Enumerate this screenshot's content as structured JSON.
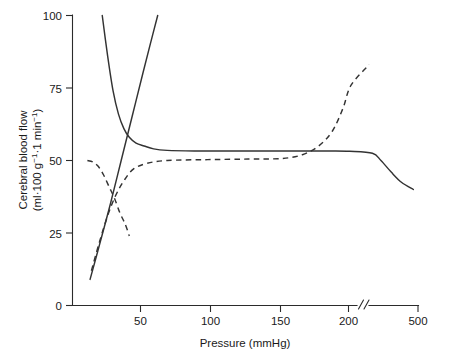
{
  "chart_data": {
    "type": "line",
    "title": "",
    "xlabel": "Pressure (mmHg)",
    "ylabel_line1": "Cerebral blood flow",
    "ylabel_line2_prefix": "(ml·100 g",
    "ylabel_line2_sup1": "−1",
    "ylabel_line2_mid": "·1 min",
    "ylabel_line2_sup2": "−1",
    "ylabel_line2_suffix": ")",
    "ylabel_full": "Cerebral blood flow (ml·100 g−1·1 min−1)",
    "xlim": [
      10,
      500
    ],
    "ylim": [
      0,
      100
    ],
    "grid": false,
    "legend": "none",
    "axis_break": {
      "present": true,
      "symbol": "//",
      "between": [
        210,
        500
      ],
      "note": "x-axis compressed after 210 mmHg up to 500 mmHg"
    },
    "xticks": [
      50,
      100,
      150,
      200,
      500
    ],
    "xtick_labels": [
      "50",
      "100",
      "150",
      "200",
      "500"
    ],
    "yticks": [
      0,
      25,
      50,
      75,
      100
    ],
    "ytick_labels": [
      "0",
      "25",
      "50",
      "75",
      "100"
    ],
    "series": [
      {
        "name": "autoregulation-plateau-solid",
        "style": "solid",
        "points": [
          [
            22,
            100
          ],
          [
            26,
            86
          ],
          [
            30,
            74
          ],
          [
            34,
            66
          ],
          [
            38,
            61
          ],
          [
            42,
            58
          ],
          [
            47,
            56
          ],
          [
            53,
            55
          ],
          [
            60,
            54
          ],
          [
            70,
            53.5
          ],
          [
            90,
            53.3
          ],
          [
            120,
            53.3
          ],
          [
            150,
            53.3
          ],
          [
            170,
            53.3
          ],
          [
            190,
            53.3
          ],
          [
            205,
            53.2
          ],
          [
            230,
            52.5
          ],
          [
            280,
            50
          ],
          [
            340,
            46
          ],
          [
            400,
            42.5
          ],
          [
            470,
            40
          ]
        ]
      },
      {
        "name": "pressure-flow-passive-rising-solid",
        "style": "solid",
        "points": [
          [
            13,
            9
          ],
          [
            20,
            21
          ],
          [
            28,
            35
          ],
          [
            36,
            50
          ],
          [
            44,
            65
          ],
          [
            52,
            80
          ],
          [
            58,
            91
          ],
          [
            63,
            100
          ]
        ]
      },
      {
        "name": "impaired-autoregulation-plateau-dashed",
        "style": "dashed",
        "points": [
          [
            11,
            50
          ],
          [
            15,
            49.5
          ],
          [
            19,
            48
          ],
          [
            23,
            45
          ],
          [
            27,
            41
          ],
          [
            31,
            37
          ],
          [
            35,
            32
          ],
          [
            39,
            28
          ],
          [
            42,
            24
          ]
        ]
      },
      {
        "name": "shifted-autoregulation-dashed",
        "style": "dashed",
        "points": [
          [
            14,
            12
          ],
          [
            20,
            22
          ],
          [
            26,
            31
          ],
          [
            32,
            38
          ],
          [
            38,
            43
          ],
          [
            45,
            47
          ],
          [
            55,
            49
          ],
          [
            70,
            50
          ],
          [
            100,
            50.3
          ],
          [
            130,
            50.5
          ],
          [
            155,
            50.7
          ],
          [
            170,
            52
          ],
          [
            182,
            55
          ],
          [
            192,
            60
          ],
          [
            200,
            68
          ],
          [
            206,
            76
          ],
          [
            211,
            83
          ]
        ]
      }
    ]
  },
  "axis": {
    "y_tick_values": [
      "100",
      "75",
      "50",
      "25",
      "0"
    ],
    "x_tick_values": [
      "50",
      "100",
      "150",
      "200",
      "500"
    ],
    "break_symbol": "//"
  }
}
